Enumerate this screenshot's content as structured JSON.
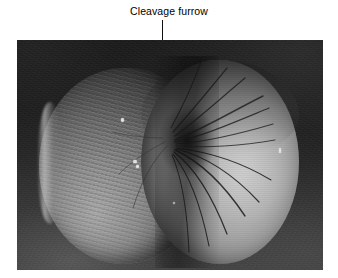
{
  "figure": {
    "caption": "Cleavage furrow",
    "leader_line": "vertical-pointer-line",
    "image_kind": "scanning-electron-micrograph",
    "palette": {
      "page_background": "#ffffff",
      "plate_background_dark": "#1b1b1b",
      "plate_background_light_corner": "#4a4a4a",
      "cell_highlight": "#c2c2c2",
      "cell_midtone": "#8e8e8e",
      "cell_shadow": "#3a3a3a",
      "furrow_dark": "#0a0a0a",
      "text_color": "#000000",
      "leader_line_color": "#101010"
    },
    "plate": {
      "left": 17,
      "top": 40,
      "width": 306,
      "height": 230
    },
    "regions": [
      {
        "name": "left-lobe",
        "description": "darker textured daughter cell half"
      },
      {
        "name": "right-lobe",
        "description": "brighter smooth daughter cell half"
      },
      {
        "name": "cleavage-furrow",
        "description": "pinched constriction between the two lobes"
      }
    ]
  }
}
